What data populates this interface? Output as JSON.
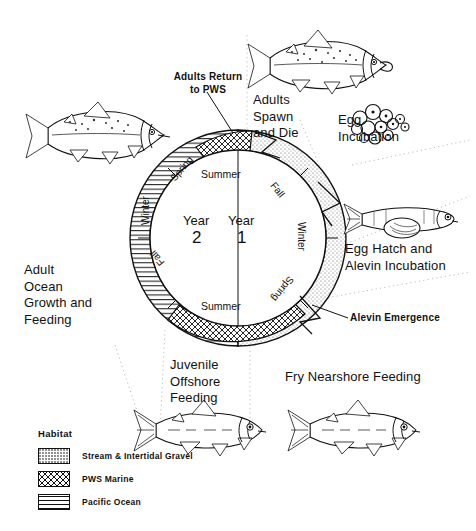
{
  "diagram": {
    "type": "cycle-diagram"
  },
  "callouts": {
    "adults_return": "Adults Return\nto PWS",
    "adults_spawn": "Adults\nSpawn\nand Die",
    "egg_incubation": "Egg\nIncubation",
    "egg_hatch": "Egg Hatch and\nAlevin Incubation",
    "alevin_emergence": "Alevin Emergence",
    "fry_nearshore": "Fry Nearshore Feeding",
    "juvenile_offshore": "Juvenile\nOffshore\nFeeding",
    "adult_ocean": "Adult\nOcean\nGrowth and\nFeeding"
  },
  "cycle": {
    "year_label": "Year",
    "year_one": "1",
    "year_two": "2",
    "summer_top": "Summer",
    "summer_bottom": "Summer",
    "seasons": {
      "spring_top_left": "Spring",
      "winter_left": "Winter",
      "fall_bottom_left": "Fall",
      "fall_top_right": "Fall",
      "winter_right": "Winter",
      "spring_bottom_right": "Spring"
    }
  },
  "legend": {
    "title": "Habitat",
    "items": [
      {
        "label": "Stream & Intertidal Gravel",
        "pattern": "stippled-dots",
        "swatch_class": "sw-gravel"
      },
      {
        "label": "PWS Marine",
        "pattern": "crosshatch",
        "swatch_class": "sw-pws"
      },
      {
        "label": "Pacific Ocean",
        "pattern": "horizontal-lines",
        "swatch_class": "sw-ocean"
      }
    ]
  },
  "illustrations": [
    {
      "name": "adult-salmon-ocean",
      "caption_ref": "adult_ocean"
    },
    {
      "name": "adult-salmon-spawning",
      "caption_ref": "adults_spawn"
    },
    {
      "name": "egg-cluster",
      "caption_ref": "egg_incubation"
    },
    {
      "name": "alevin-with-yolk-sac",
      "caption_ref": "egg_hatch"
    },
    {
      "name": "fry-salmon",
      "caption_ref": "fry_nearshore"
    },
    {
      "name": "juvenile-salmon",
      "caption_ref": "juvenile_offshore"
    }
  ],
  "colors": {
    "ink": "#111111",
    "paper": "#ffffff"
  }
}
